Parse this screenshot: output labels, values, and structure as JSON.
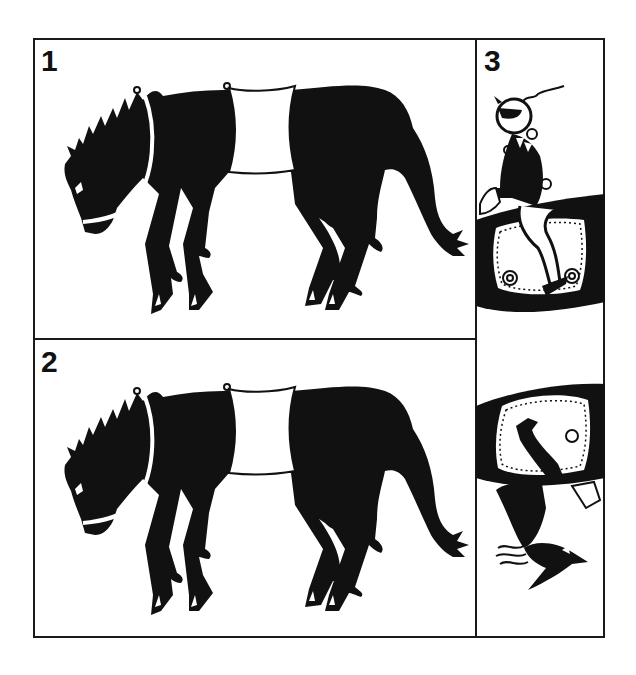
{
  "figure": {
    "colors": {
      "ink": "#111111",
      "paper": "#ffffff",
      "frame": "#1a1a1a"
    },
    "panels": [
      {
        "number": "1",
        "subject": "horse-silhouette",
        "description": "Black horse silhouette, head lowered, with white saddle-cloth band and white neck strap"
      },
      {
        "number": "2",
        "subject": "horse-silhouette",
        "description": "Same black horse silhouette as panel 1"
      },
      {
        "number": "3",
        "subject": "rider-figures",
        "description": "Vertical strip: a seated figure on a decorated saddle cloth above, and an inverted mirrored figure below"
      }
    ]
  }
}
